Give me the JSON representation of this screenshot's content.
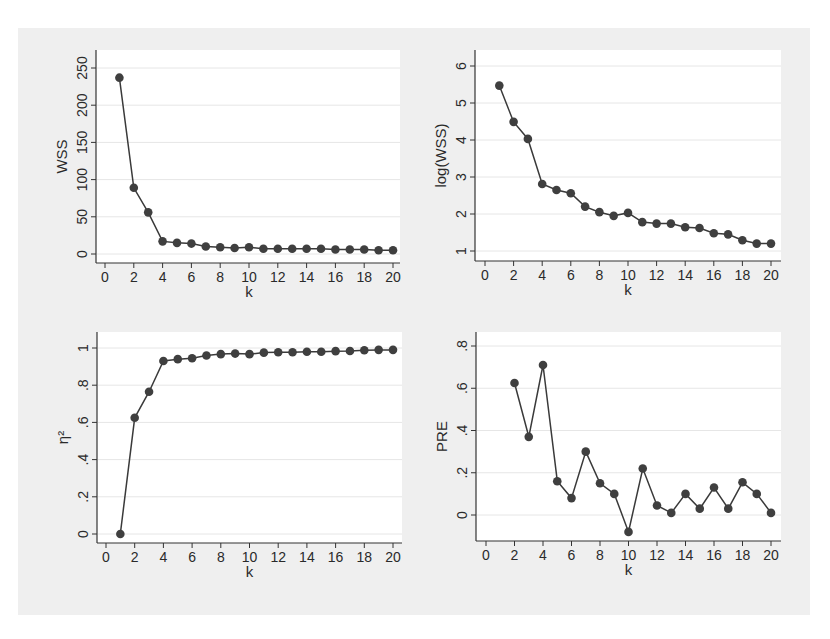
{
  "figure": {
    "background": "#efefef",
    "plot_background": "#ffffff",
    "line_color": "#3a3a3a",
    "marker_color": "#3f3f3f",
    "grid_color": "#e6e6e6"
  },
  "chart_data": [
    {
      "type": "line",
      "panel": "top-left",
      "title": "",
      "xlabel": "k",
      "ylabel": "WSS",
      "xlim": [
        0,
        20
      ],
      "ylim": [
        0,
        250
      ],
      "xticks": [
        0,
        2,
        4,
        6,
        8,
        10,
        12,
        14,
        16,
        18,
        20
      ],
      "yticks": [
        0,
        50,
        100,
        150,
        200,
        250
      ],
      "ytick_labels": [
        "0",
        "50",
        "100",
        "150",
        "200",
        "250"
      ],
      "grid": true,
      "x": [
        1,
        2,
        3,
        4,
        5,
        6,
        7,
        8,
        9,
        10,
        11,
        12,
        13,
        14,
        15,
        16,
        17,
        18,
        19,
        20
      ],
      "values": [
        237,
        89,
        56,
        17,
        15,
        14,
        10,
        9,
        8,
        9,
        7,
        7,
        7,
        7,
        7,
        6,
        6,
        6,
        5,
        5
      ],
      "frame": {
        "left": 96,
        "top": 50,
        "right": 400,
        "bottom": 263,
        "x0px": 105,
        "x20px": 393,
        "ytop_px": 68,
        "ybot_px": 254
      }
    },
    {
      "type": "line",
      "panel": "top-right",
      "title": "",
      "xlabel": "k",
      "ylabel": "log(WSS)",
      "xlim": [
        0,
        20
      ],
      "ylim": [
        1,
        6
      ],
      "xticks": [
        0,
        2,
        4,
        6,
        8,
        10,
        12,
        14,
        16,
        18,
        20
      ],
      "yticks": [
        1,
        2,
        3,
        4,
        5,
        6
      ],
      "ytick_labels": [
        "1",
        "2",
        "3",
        "4",
        "5",
        "6"
      ],
      "grid": true,
      "x": [
        1,
        2,
        3,
        4,
        5,
        6,
        7,
        8,
        9,
        10,
        11,
        12,
        13,
        14,
        15,
        16,
        17,
        18,
        19,
        20
      ],
      "values": [
        5.47,
        4.49,
        4.03,
        2.81,
        2.65,
        2.56,
        2.2,
        2.05,
        1.95,
        2.03,
        1.78,
        1.74,
        1.74,
        1.64,
        1.62,
        1.48,
        1.45,
        1.29,
        1.2,
        1.2
      ],
      "frame": {
        "left": 475,
        "top": 50,
        "right": 781,
        "bottom": 261,
        "x0px": 485,
        "x20px": 771,
        "ytop_px": 66,
        "ybot_px": 251
      }
    },
    {
      "type": "line",
      "panel": "bottom-left",
      "title": "",
      "xlabel": "k",
      "ylabel": "η²",
      "xlim": [
        0,
        20
      ],
      "ylim": [
        0,
        1
      ],
      "xticks": [
        0,
        2,
        4,
        6,
        8,
        10,
        12,
        14,
        16,
        18,
        20
      ],
      "yticks": [
        0,
        0.2,
        0.4,
        0.6,
        0.8,
        1
      ],
      "ytick_labels": [
        "0",
        ".2",
        ".4",
        ".6",
        ".8",
        "1"
      ],
      "grid": true,
      "x": [
        1,
        2,
        3,
        4,
        5,
        6,
        7,
        8,
        9,
        10,
        11,
        12,
        13,
        14,
        15,
        16,
        17,
        18,
        19,
        20
      ],
      "values": [
        0,
        0.625,
        0.765,
        0.93,
        0.94,
        0.945,
        0.96,
        0.967,
        0.97,
        0.967,
        0.975,
        0.977,
        0.977,
        0.98,
        0.98,
        0.983,
        0.984,
        0.988,
        0.99,
        0.99
      ],
      "frame": {
        "left": 97,
        "top": 332,
        "right": 402,
        "bottom": 543,
        "x0px": 106,
        "x20px": 393,
        "ytop_px": 348,
        "ybot_px": 534
      }
    },
    {
      "type": "line",
      "panel": "bottom-right",
      "title": "",
      "xlabel": "k",
      "ylabel": "PRE",
      "xlim": [
        0,
        20
      ],
      "ylim": [
        0,
        0.8
      ],
      "xticks": [
        0,
        2,
        4,
        6,
        8,
        10,
        12,
        14,
        16,
        18,
        20
      ],
      "yticks": [
        0,
        0.2,
        0.4,
        0.6,
        0.8
      ],
      "ytick_labels": [
        "0",
        ".2",
        ".4",
        ".6",
        ".8"
      ],
      "grid": true,
      "x": [
        2,
        3,
        4,
        5,
        6,
        7,
        8,
        9,
        10,
        11,
        12,
        13,
        14,
        15,
        16,
        17,
        18,
        19,
        20
      ],
      "values": [
        0.625,
        0.37,
        0.71,
        0.16,
        0.08,
        0.3,
        0.15,
        0.1,
        -0.08,
        0.22,
        0.045,
        0.01,
        0.1,
        0.03,
        0.13,
        0.03,
        0.155,
        0.1,
        0.01
      ],
      "frame": {
        "left": 476,
        "top": 332,
        "right": 781,
        "bottom": 541,
        "x0px": 486,
        "x20px": 771,
        "ytop_px": 346,
        "ybot_px": 515
      }
    }
  ]
}
